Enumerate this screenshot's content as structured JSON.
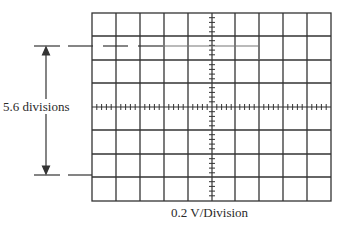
{
  "diagram": {
    "type": "oscilloscope-screen",
    "grid": {
      "columns": 10,
      "rows": 8,
      "minor_ticks_per_division": 5
    },
    "measurement": {
      "label": "5.6 divisions",
      "value_divisions": 5.6,
      "arrow": "double-headed vertical"
    },
    "scale_label": "0.2 V/Division",
    "volts_per_division": 0.2,
    "trace": {
      "description": "square-wave levels: upper level drawn as dashed reference on left, solid trace to step; lower level reference line",
      "upper_level_division_from_top": 1.4,
      "lower_level_division_from_top": 7.0
    },
    "colors": {
      "grid": "#333333",
      "trace": "#777777",
      "background": "#ffffff"
    }
  }
}
